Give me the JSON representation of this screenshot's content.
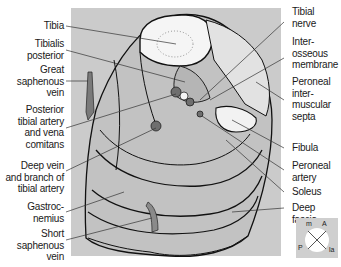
{
  "figure": {
    "labels_left": [
      {
        "id": "tibia",
        "text": "Tibia"
      },
      {
        "id": "tibialis-posterior",
        "text": "Tibialis\nposterior"
      },
      {
        "id": "great-saphenous-vein",
        "text": "Great\nsaphenous\nvein"
      },
      {
        "id": "posterior-tibial-artery",
        "text": "Posterior\ntibial artery\nand vena\ncomitans"
      },
      {
        "id": "deep-vein-branch",
        "text": "Deep vein\nand branch of\ntibial artery"
      },
      {
        "id": "gastrocnemius",
        "text": "Gastroc-\nnemius"
      },
      {
        "id": "short-saphenous-vein",
        "text": "Short\nsaphenous\nvein"
      }
    ],
    "labels_right": [
      {
        "id": "tibial-nerve",
        "text": "Tibial\nnerve"
      },
      {
        "id": "interosseous-membrane",
        "text": "Inter-\nosseous\nmembrane"
      },
      {
        "id": "peroneal-intermuscular-septa",
        "text": "Peroneal\ninter-\nmuscular\nsepta"
      },
      {
        "id": "fibula",
        "text": "Fibula"
      },
      {
        "id": "peroneal-artery",
        "text": "Peroneal\nartery"
      },
      {
        "id": "soleus",
        "text": "Soleus"
      },
      {
        "id": "deep-fascia",
        "text": "Deep fascia"
      }
    ],
    "orientation": {
      "top_left": "m",
      "top_right": "A",
      "bottom_left": "P",
      "bottom_right": "la"
    },
    "colors": {
      "panel": "#c8c8c8",
      "muscle": "#bdbdbd",
      "bone": "#f4f4f4",
      "vessel": "#7a7a7a",
      "outline": "#111111"
    }
  }
}
